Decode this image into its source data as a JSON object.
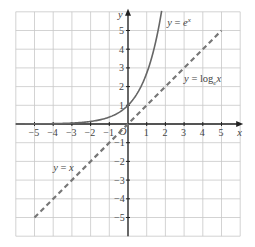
{
  "chart_data": {
    "type": "line",
    "title": "",
    "xlabel": "x",
    "ylabel": "y",
    "xlim": [
      -6,
      6
    ],
    "ylim": [
      -6,
      6
    ],
    "grid": true,
    "x_ticks": [
      -5,
      -4,
      -3,
      -2,
      -1,
      1,
      2,
      3,
      4,
      5
    ],
    "y_ticks": [
      5,
      4,
      3,
      2,
      1,
      -1,
      -2,
      -3,
      -4,
      -5
    ],
    "origin_label": "O",
    "series": [
      {
        "name": "y = e^x",
        "label_text": "y = e",
        "label_sup": "x",
        "style": "solid",
        "color": "#666666",
        "points": [
          [
            -6,
            0.0025
          ],
          [
            -5,
            0.0067
          ],
          [
            -4,
            0.018
          ],
          [
            -3,
            0.05
          ],
          [
            -2,
            0.135
          ],
          [
            -1,
            0.368
          ],
          [
            0,
            1
          ],
          [
            0.5,
            1.65
          ],
          [
            1,
            2.72
          ],
          [
            1.5,
            4.48
          ],
          [
            1.8,
            6.05
          ]
        ]
      },
      {
        "name": "y = log_e x",
        "label_text": "y = log",
        "label_sub": "e",
        "label_tail": "x",
        "style": "solid",
        "color": "#333333",
        "points": [
          [
            0.0025,
            -6
          ],
          [
            0.01,
            -4.6
          ],
          [
            0.05,
            -3
          ],
          [
            0.1,
            -2.3
          ],
          [
            0.25,
            -1.39
          ],
          [
            0.5,
            -0.69
          ],
          [
            1,
            0
          ],
          [
            2,
            0.69
          ],
          [
            3,
            1.1
          ],
          [
            4,
            1.39
          ],
          [
            5,
            1.61
          ],
          [
            6,
            1.79
          ]
        ]
      },
      {
        "name": "y = x",
        "label_text": "y = x",
        "style": "dashed",
        "color": "#777777",
        "points": [
          [
            -5,
            -5
          ],
          [
            5,
            5
          ]
        ]
      }
    ]
  }
}
